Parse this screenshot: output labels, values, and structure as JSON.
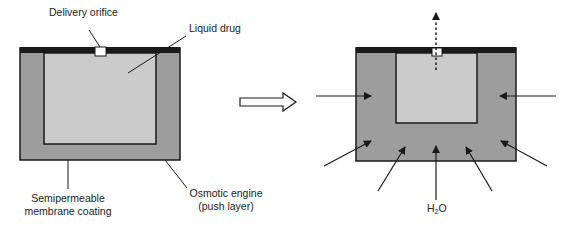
{
  "diagram": {
    "colors": {
      "outer_engine": "#9d9d9d",
      "inner_drug": "#cbcbcb",
      "top_bar": "#1a1a1a",
      "orifice": "#ffffff",
      "stroke": "#1a1a1a"
    },
    "left_device": {
      "state": "before",
      "labels": {
        "orifice": "Delivery orifice",
        "drug": "Liquid drug",
        "membrane_line1": "Semipermeable",
        "membrane_line2": "membrane coating",
        "engine_line1": "Osmotic engine",
        "engine_line2": "(push layer)"
      }
    },
    "transition_arrow": {
      "icon": "hollow-right-arrow-icon"
    },
    "right_device": {
      "state": "after",
      "water_label": {
        "main": "H",
        "sub": "2",
        "tail": "O"
      },
      "inflow_arrows": 7,
      "outflow_arrow": "dotted-up-arrow"
    }
  }
}
